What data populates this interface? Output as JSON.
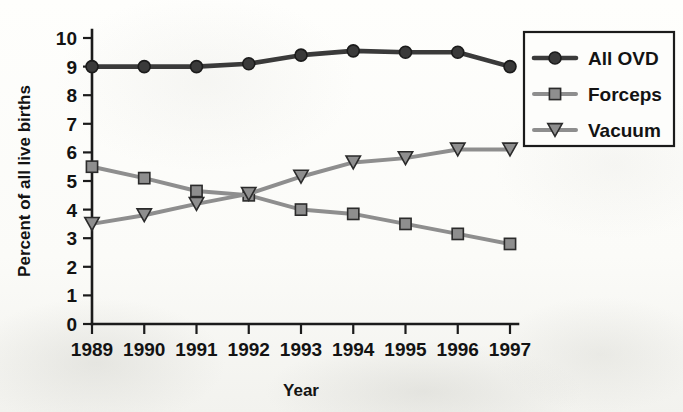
{
  "chart_data": {
    "type": "line",
    "title": "",
    "xlabel": "Year",
    "ylabel": "Percent of all live births",
    "categories": [
      "1989",
      "1990",
      "1991",
      "1992",
      "1993",
      "1994",
      "1995",
      "1996",
      "1997"
    ],
    "x": [
      1989,
      1990,
      1991,
      1992,
      1993,
      1994,
      1995,
      1996,
      1997
    ],
    "xlim": [
      1989,
      1997
    ],
    "ylim": [
      0,
      10
    ],
    "y_ticks": [
      "0",
      "1",
      "2",
      "3",
      "4",
      "5",
      "6",
      "7",
      "8",
      "9",
      "10"
    ],
    "grid": false,
    "legend_position": "top-right",
    "series": [
      {
        "name": "All OVD",
        "marker": "circle",
        "color": "#3a3a3a",
        "values": [
          9.0,
          9.0,
          9.0,
          9.1,
          9.4,
          9.55,
          9.5,
          9.5,
          9.0
        ]
      },
      {
        "name": "Forceps",
        "marker": "square",
        "color": "#8e8e8e",
        "values": [
          5.5,
          5.1,
          4.65,
          4.5,
          4.0,
          3.85,
          3.5,
          3.15,
          2.8
        ]
      },
      {
        "name": "Vacuum",
        "marker": "triangle-down",
        "color": "#8e8e8e",
        "values": [
          3.5,
          3.8,
          4.2,
          4.55,
          5.15,
          5.65,
          5.8,
          6.1,
          6.1
        ]
      }
    ]
  },
  "legend": {
    "items": [
      {
        "label": "All OVD"
      },
      {
        "label": "Forceps"
      },
      {
        "label": "Vacuum"
      }
    ]
  },
  "axes": {
    "x_title": "Year",
    "y_title": "Percent of all live births"
  },
  "colors": {
    "all_ovd": "#3a3a3a",
    "forceps": "#8e8e8e",
    "vacuum": "#8e8e8e",
    "axis": "#1b1b1b",
    "background": "#fdfdfb"
  }
}
